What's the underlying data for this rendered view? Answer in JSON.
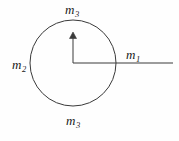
{
  "figure": {
    "background_color": "#fefefe",
    "stroke_color": "#3a3a3a",
    "text_color": "#1a1a1a"
  },
  "labels": {
    "top": {
      "symbol": "m",
      "subscript": "3",
      "full": "m3"
    },
    "left": {
      "symbol": "m",
      "subscript": "2",
      "full": "m2"
    },
    "right": {
      "symbol": "m",
      "subscript": "1",
      "full": "m1"
    },
    "bottom": {
      "symbol": "m",
      "subscript": "3",
      "full": "m3"
    }
  },
  "geometry": {
    "circle": {
      "cx": 73,
      "cy": 63,
      "r": 43
    },
    "vertical_arrow": {
      "x": 73,
      "y_start": 63,
      "y_end": 34,
      "arrowhead": "up"
    },
    "horizontal_line": {
      "y": 63,
      "x_start": 73,
      "x_end": 173
    }
  }
}
